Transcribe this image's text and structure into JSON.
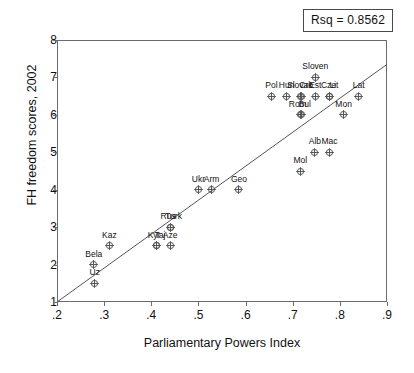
{
  "annotation": {
    "rsq_label": "Rsq = 0.8562"
  },
  "chart_data": {
    "type": "scatter",
    "title": "",
    "xlabel": "Parliamentary Powers Index",
    "ylabel": "FH freedom scores, 2002",
    "xlim": [
      0.2,
      0.9
    ],
    "ylim": [
      1,
      8
    ],
    "grid": false,
    "legend": "none",
    "xticks": [
      ".2",
      ".3",
      ".4",
      ".5",
      ".6",
      ".7",
      ".8",
      ".9"
    ],
    "xtick_values": [
      0.2,
      0.3,
      0.4,
      0.5,
      0.6,
      0.7,
      0.8,
      0.9
    ],
    "yticks": [
      "1",
      "2",
      "3",
      "4",
      "5",
      "6",
      "7",
      "8"
    ],
    "ytick_values": [
      1,
      2,
      3,
      4,
      5,
      6,
      7,
      8
    ],
    "r_squared": 0.8562,
    "fit_line": {
      "x0": 0.2,
      "y0": 1.0,
      "x1": 0.9,
      "y1": 7.35
    },
    "marker_style": "circle-with-cross",
    "marker_color": "#555555",
    "points": [
      {
        "label": "Uz",
        "x": 0.28,
        "y": 1.5,
        "label_dx": 0,
        "label_dy": -7
      },
      {
        "label": "Bela",
        "x": 0.278,
        "y": 2.0,
        "label_dx": 0,
        "label_dy": -7
      },
      {
        "label": "Kaz",
        "x": 0.311,
        "y": 2.5,
        "label_dx": 0,
        "label_dy": -7
      },
      {
        "label": "Kyr",
        "x": 0.41,
        "y": 2.5,
        "label_dx": -2,
        "label_dy": -7
      },
      {
        "label": "Taj",
        "x": 0.412,
        "y": 2.5,
        "label_dx": 3,
        "label_dy": -7
      },
      {
        "label": "Aze",
        "x": 0.44,
        "y": 2.5,
        "label_dx": 0,
        "label_dy": -7
      },
      {
        "label": "Rus",
        "x": 0.44,
        "y": 3.0,
        "label_dx": -2,
        "label_dy": -7
      },
      {
        "label": "Turk",
        "x": 0.441,
        "y": 3.0,
        "label_dx": 3,
        "label_dy": -7
      },
      {
        "label": "Ukr",
        "x": 0.5,
        "y": 4.0,
        "label_dx": 0,
        "label_dy": -7
      },
      {
        "label": "Arm",
        "x": 0.528,
        "y": 4.0,
        "label_dx": 0,
        "label_dy": -7
      },
      {
        "label": "Geo",
        "x": 0.586,
        "y": 4.0,
        "label_dx": 0,
        "label_dy": -7
      },
      {
        "label": "Mol",
        "x": 0.716,
        "y": 4.5,
        "label_dx": 0,
        "label_dy": -7
      },
      {
        "label": "Alb",
        "x": 0.747,
        "y": 5.0,
        "label_dx": 0,
        "label_dy": -7
      },
      {
        "label": "Mac",
        "x": 0.778,
        "y": 5.0,
        "label_dx": 0,
        "label_dy": -7
      },
      {
        "label": "Rom",
        "x": 0.717,
        "y": 6.0,
        "label_dx": -3,
        "label_dy": -7
      },
      {
        "label": "Bul",
        "x": 0.719,
        "y": 6.0,
        "label_dx": 3,
        "label_dy": -7
      },
      {
        "label": "Mon",
        "x": 0.808,
        "y": 6.0,
        "label_dx": 0,
        "label_dy": -7
      },
      {
        "label": "Pol",
        "x": 0.655,
        "y": 6.5,
        "label_dx": 0,
        "label_dy": -7
      },
      {
        "label": "Hun",
        "x": 0.687,
        "y": 6.5,
        "label_dx": 0,
        "label_dy": -7
      },
      {
        "label": "Slovak",
        "x": 0.717,
        "y": 6.5,
        "label_dx": -1,
        "label_dy": -7
      },
      {
        "label": "Cro",
        "x": 0.718,
        "y": 6.5,
        "label_dx": 5,
        "label_dy": -7
      },
      {
        "label": "Est",
        "x": 0.748,
        "y": 6.5,
        "label_dx": 0,
        "label_dy": -7
      },
      {
        "label": "Cze",
        "x": 0.778,
        "y": 6.5,
        "label_dx": -1,
        "label_dy": -7
      },
      {
        "label": "Lit",
        "x": 0.779,
        "y": 6.5,
        "label_dx": 4,
        "label_dy": -7
      },
      {
        "label": "Lat",
        "x": 0.84,
        "y": 6.5,
        "label_dx": 0,
        "label_dy": -7
      },
      {
        "label": "Sloven",
        "x": 0.748,
        "y": 7.0,
        "label_dx": 0,
        "label_dy": -7
      }
    ]
  }
}
